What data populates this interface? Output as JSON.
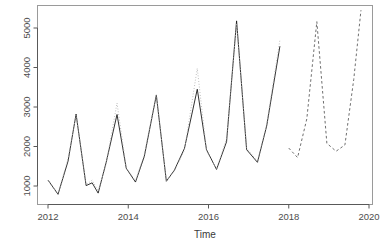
{
  "chart_data": {
    "type": "line",
    "title": "",
    "subtitle": "",
    "xlabel": "Time",
    "ylabel": "",
    "xlim": [
      2011.85,
      2019.95
    ],
    "ylim": [
      700,
      5600
    ],
    "xticks": [
      2012,
      2014,
      2016,
      2018,
      2020
    ],
    "xtick_labels": [
      "2012",
      "2014",
      "2016",
      "2018",
      "2020"
    ],
    "yticks": [
      1000,
      2000,
      3000,
      4000,
      5000
    ],
    "ytick_labels": [
      "1000",
      "2000",
      "3000",
      "4000",
      "5000"
    ],
    "grid": false,
    "legend": false,
    "legend_position": "none",
    "box": true,
    "colors": {
      "observed": "#1a1a1a",
      "fitted": "#b0b0b0",
      "forecast": "#6e6e6e",
      "axis": "#595959",
      "box": "#9a9a9a",
      "background": "#ffffff"
    },
    "series": [
      {
        "name": "observed",
        "style": "solid",
        "color": "#1a1a1a",
        "x": [
          2012.0,
          2012.25,
          2012.5,
          2012.7,
          2012.95,
          2013.1,
          2013.25,
          2013.45,
          2013.72,
          2013.95,
          2014.18,
          2014.4,
          2014.7,
          2014.95,
          2015.15,
          2015.4,
          2015.72,
          2015.95,
          2016.2,
          2016.45,
          2016.7,
          2016.95,
          2017.22,
          2017.45,
          2017.78
        ],
        "y": [
          1150,
          790,
          1630,
          2820,
          1010,
          1080,
          820,
          1600,
          2810,
          1450,
          1100,
          1750,
          3300,
          1120,
          1400,
          1950,
          3450,
          1920,
          1420,
          2120,
          5180,
          1920,
          1600,
          2520,
          4540
        ]
      },
      {
        "name": "fitted",
        "style": "dotted",
        "color": "#b0b0b0",
        "x": [
          2012.0,
          2012.25,
          2012.5,
          2012.7,
          2012.95,
          2013.1,
          2013.25,
          2013.45,
          2013.72,
          2013.95,
          2014.18,
          2014.4,
          2014.7,
          2014.95,
          2015.15,
          2015.4,
          2015.72,
          2015.95,
          2016.2,
          2016.45,
          2016.7,
          2016.95,
          2017.22,
          2017.45,
          2017.78
        ],
        "y": [
          1150,
          790,
          1700,
          2800,
          1030,
          1150,
          870,
          1560,
          3100,
          1460,
          1130,
          1800,
          3320,
          1130,
          1380,
          1900,
          3980,
          1900,
          1420,
          2200,
          5120,
          1960,
          1620,
          2560,
          4700
        ]
      },
      {
        "name": "forecast",
        "style": "dashed",
        "color": "#6e6e6e",
        "x": [
          2018.0,
          2018.22,
          2018.45,
          2018.7,
          2018.95,
          2019.18,
          2019.4,
          2019.62,
          2019.8
        ],
        "y": [
          1960,
          1720,
          2700,
          5160,
          2080,
          1880,
          2040,
          3700,
          5450
        ]
      }
    ],
    "annotations": []
  },
  "axis": {
    "x_title": "Time",
    "y_title": ""
  }
}
